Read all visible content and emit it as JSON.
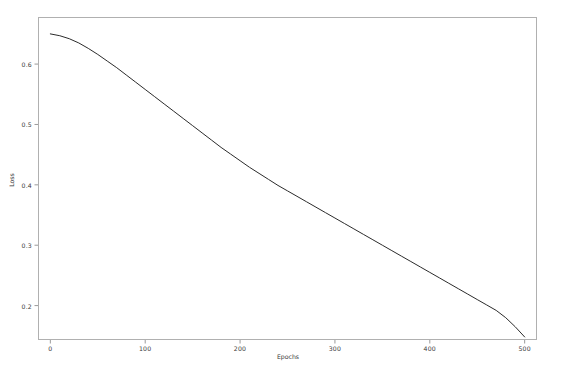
{
  "chart_data": {
    "type": "line",
    "title": "",
    "xlabel": "Epochs",
    "ylabel": "Loss",
    "xlim": [
      -13,
      513
    ],
    "ylim": [
      0.143,
      0.678
    ],
    "xticks": [
      0,
      100,
      200,
      300,
      400,
      500
    ],
    "xtick_labels": [
      "0",
      "100",
      "200",
      "300",
      "400",
      "500"
    ],
    "yticks": [
      0.2,
      0.3,
      0.4,
      0.5,
      0.6
    ],
    "ytick_labels": [
      "0.2",
      "0.3",
      "0.4",
      "0.5",
      "0.6"
    ],
    "grid": false,
    "legend": null,
    "line_color": "#2b2b2b",
    "line_width": 1.0,
    "series": [
      {
        "name": "Loss",
        "x": [
          0,
          10,
          20,
          30,
          40,
          50,
          60,
          70,
          80,
          90,
          100,
          110,
          120,
          130,
          140,
          150,
          160,
          170,
          180,
          190,
          200,
          210,
          220,
          230,
          240,
          250,
          260,
          270,
          280,
          290,
          300,
          310,
          320,
          330,
          340,
          350,
          360,
          370,
          380,
          390,
          400,
          410,
          420,
          430,
          440,
          450,
          460,
          470,
          480,
          490,
          500
        ],
        "y": [
          0.65,
          0.647,
          0.642,
          0.635,
          0.626,
          0.616,
          0.605,
          0.594,
          0.582,
          0.57,
          0.558,
          0.546,
          0.534,
          0.522,
          0.51,
          0.498,
          0.486,
          0.474,
          0.462,
          0.451,
          0.44,
          0.429,
          0.419,
          0.409,
          0.399,
          0.39,
          0.381,
          0.372,
          0.363,
          0.354,
          0.345,
          0.336,
          0.327,
          0.318,
          0.309,
          0.3,
          0.291,
          0.282,
          0.273,
          0.264,
          0.255,
          0.246,
          0.237,
          0.228,
          0.219,
          0.21,
          0.201,
          0.192,
          0.18,
          0.165,
          0.148
        ]
      }
    ]
  },
  "axes": {
    "frame_color": "#b0b0b0",
    "tick_color": "#9a9a9a",
    "label_color": "#3a3a3a"
  }
}
